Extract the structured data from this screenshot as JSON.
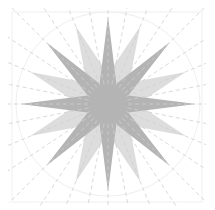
{
  "diagram": {
    "type": "compass-rose-star",
    "center": [
      108,
      104
    ],
    "dark_star": {
      "points": 8,
      "outer_radius": 88,
      "inner_radius": 22,
      "rotation_deg": 0,
      "color": "#b4b4b4"
    },
    "light_star": {
      "points": 8,
      "outer_radius": 84,
      "inner_radius": 30,
      "rotation_deg": 22.5,
      "color": "#dddddd"
    },
    "radial_lines": {
      "count": 32,
      "color": "#cfcfcf",
      "dash": "4 3"
    },
    "border": {
      "x": 12,
      "y": 12,
      "size": 190,
      "color": "#efefef"
    },
    "circle": {
      "radius": 92,
      "color": "#efefef"
    },
    "background": "#ffffff"
  }
}
